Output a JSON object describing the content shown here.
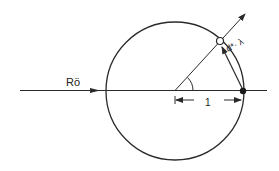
{
  "diagram": {
    "type": "ewald-sphere-construction",
    "labels": {
      "incident_beam": "Rö",
      "radius": "1",
      "reciprocal_vector": "d*· λ"
    },
    "colors": {
      "stroke": "#2a2a2a",
      "background": "#ffffff"
    },
    "elements": [
      {
        "name": "ewald-circle",
        "kind": "circle"
      },
      {
        "name": "incident-beam-line",
        "kind": "line-with-arrow",
        "label": "Rö"
      },
      {
        "name": "diffracted-ray",
        "kind": "arrow"
      },
      {
        "name": "reciprocal-vector",
        "kind": "arrow",
        "label": "d*· λ"
      },
      {
        "name": "origin-point",
        "kind": "filled-dot"
      },
      {
        "name": "reflection-point",
        "kind": "open-dot"
      },
      {
        "name": "angle-arc",
        "kind": "arc"
      },
      {
        "name": "radius-dimension",
        "kind": "dimension",
        "label": "1"
      }
    ]
  }
}
